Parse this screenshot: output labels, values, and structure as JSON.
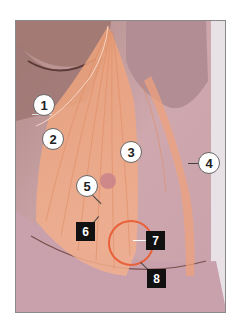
{
  "figure": {
    "type": "anatomical photograph with overlay",
    "highlight_color": "#e8613a",
    "overlay_color": "#f0a070",
    "labels": [
      {
        "id": "1",
        "style": "circle"
      },
      {
        "id": "2",
        "style": "circle"
      },
      {
        "id": "3",
        "style": "circle"
      },
      {
        "id": "4",
        "style": "circle"
      },
      {
        "id": "5",
        "style": "circle"
      },
      {
        "id": "6",
        "style": "square"
      },
      {
        "id": "7",
        "style": "square"
      },
      {
        "id": "8",
        "style": "square"
      }
    ]
  }
}
